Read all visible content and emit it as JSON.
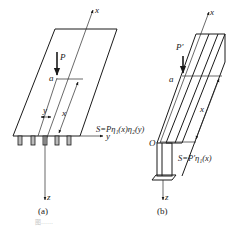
{
  "figure_a": {
    "label": "(a)",
    "axes": {
      "x": "x",
      "y": "y",
      "z": "z"
    },
    "load": "P",
    "distance_a": "a",
    "dim_x": "x",
    "dim_y": "y",
    "formula": "S=Pη₁(x)η₂(y)"
  },
  "figure_b": {
    "label": "(b)",
    "axes": {
      "x": "x",
      "z": "z"
    },
    "origin": "O",
    "load": "P′",
    "distance_a": "a",
    "dim_x": "x",
    "formula": "S=P′η₁(x)"
  },
  "caption": "图……"
}
